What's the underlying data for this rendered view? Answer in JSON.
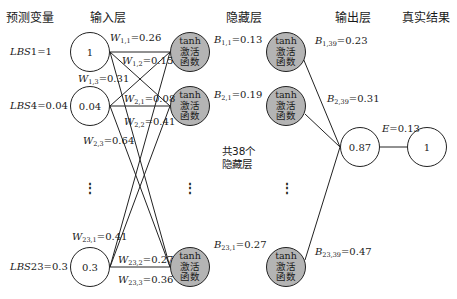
{
  "headers": {
    "predictor": "预测变量",
    "input": "输入层",
    "hidden": "隐藏层",
    "output": "输出层",
    "truth": "真实结果"
  },
  "predictors": [
    {
      "name": "LBS",
      "index": "1",
      "value": "=1"
    },
    {
      "name": "LBS",
      "index": "4",
      "value": "=0.04"
    },
    {
      "name": "LBS",
      "index": "23",
      "value": "=0.3"
    }
  ],
  "input_nodes": [
    "1",
    "0.04",
    "0.3"
  ],
  "activation": {
    "top": "tanh",
    "line1": "激活",
    "line2": "函数"
  },
  "weights": [
    {
      "sym": "W",
      "sub": "1,1",
      "val": "=0.26"
    },
    {
      "sym": "W",
      "sub": "1,2",
      "val": "=0.15"
    },
    {
      "sym": "W",
      "sub": "1,3",
      "val": "=0.31"
    },
    {
      "sym": "W",
      "sub": "2,1",
      "val": "=0.08"
    },
    {
      "sym": "W",
      "sub": "2,2",
      "val": "=0.41"
    },
    {
      "sym": "W",
      "sub": "2,3",
      "val": "=0.64"
    },
    {
      "sym": "W",
      "sub": "23,1",
      "val": "=0.41"
    },
    {
      "sym": "W",
      "sub": "23,2",
      "val": "=0.27"
    },
    {
      "sym": "W",
      "sub": "23,3",
      "val": "=0.36"
    }
  ],
  "biases_first": [
    {
      "sym": "B",
      "sub": "1,1",
      "val": "=0.13"
    },
    {
      "sym": "B",
      "sub": "2,1",
      "val": "=0.19"
    },
    {
      "sym": "B",
      "sub": "23,1",
      "val": "=0.27"
    }
  ],
  "biases_last": [
    {
      "sym": "B",
      "sub": "1,39",
      "val": "=0.23"
    },
    {
      "sym": "B",
      "sub": "2,39",
      "val": "=0.31"
    },
    {
      "sym": "B",
      "sub": "23,39",
      "val": "=0.47"
    }
  ],
  "hidden_note": {
    "line1": "共38个",
    "line2": "隐藏层"
  },
  "ellipsis": "⋮",
  "output_node": "0.87",
  "error": {
    "sym": "E",
    "val": "=0.13"
  },
  "truth_node": "1",
  "colors": {
    "activation_fill": "#b4b4b4",
    "stroke": "#222222"
  }
}
